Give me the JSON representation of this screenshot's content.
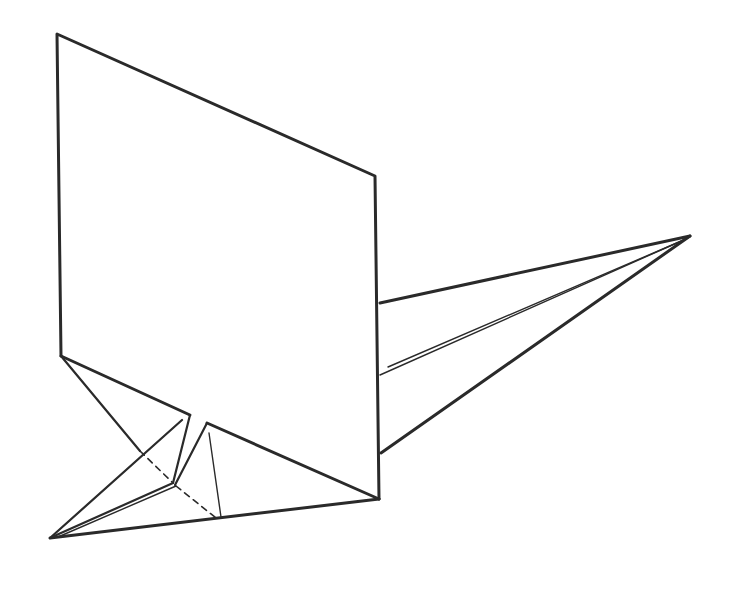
{
  "diagram": {
    "type": "origami-fold-illustration",
    "colors": {
      "stroke": "#2a2a2a",
      "background": "#ffffff"
    },
    "panel": {
      "points": [
        [
          57,
          34
        ],
        [
          375,
          176
        ],
        [
          379,
          499
        ],
        [
          61,
          356
        ]
      ]
    },
    "right_flap": {
      "tip": [
        690,
        236
      ],
      "upper_base": [
        380,
        303
      ],
      "lower_base": [
        381,
        453
      ],
      "double_line_start": [
        380,
        375
      ]
    },
    "left_flap": {
      "tip": [
        50,
        538
      ],
      "panel_bottom_left": [
        61,
        356
      ],
      "panel_bottom_right": [
        379,
        499
      ],
      "fold_a_top": [
        190,
        415
      ],
      "fold_b_top": [
        207,
        423
      ],
      "fold_joint": [
        173,
        483
      ],
      "inner_foot": [
        218,
        518
      ],
      "inner_top": [
        209,
        433
      ],
      "crease_top": [
        182,
        420
      ],
      "crease_cross": [
        140,
        451
      ]
    }
  }
}
